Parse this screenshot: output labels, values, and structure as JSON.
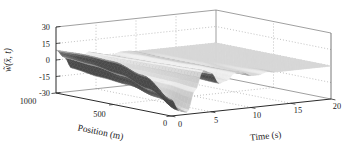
{
  "chart_data": {
    "type": "surface",
    "title": "",
    "time_axis": {
      "label": "Time (s)",
      "range": [
        0,
        20
      ],
      "ticks": [
        0,
        5,
        10,
        15,
        20
      ]
    },
    "position_axis": {
      "label": "Position (m)",
      "range": [
        0,
        1000
      ],
      "ticks": [
        0,
        500,
        1000
      ]
    },
    "z_axis": {
      "label": "w̃(x̄, t)",
      "range": [
        -30,
        30
      ],
      "ticks": [
        -30,
        -15,
        0,
        15,
        30
      ]
    },
    "surface": {
      "positions": [
        0,
        250,
        500,
        750,
        1000
      ],
      "times": [
        0,
        1,
        2,
        3,
        4,
        5,
        6,
        7,
        8,
        9,
        10,
        11,
        12,
        13,
        14,
        15,
        16,
        17,
        18,
        19,
        20
      ],
      "z_values": [
        [
          -15,
          -26,
          -28,
          -9,
          8,
          5,
          -5,
          -3,
          3,
          2,
          -1,
          -1,
          1,
          0,
          0,
          0,
          0,
          0,
          0,
          0,
          0
        ],
        [
          2,
          -12,
          -20,
          -7,
          7,
          4,
          -4,
          -2,
          3,
          1,
          -1,
          -1,
          0,
          0,
          0,
          0,
          0,
          0,
          0,
          0,
          0
        ],
        [
          9,
          -4,
          -14,
          -6,
          6,
          3,
          -4,
          -2,
          2,
          1,
          -1,
          0,
          0,
          0,
          0,
          0,
          0,
          0,
          0,
          0,
          0
        ],
        [
          10,
          0,
          -12,
          -5,
          5,
          3,
          -3,
          -1,
          2,
          1,
          -1,
          0,
          0,
          0,
          0,
          0,
          0,
          0,
          0,
          0,
          0
        ],
        [
          9,
          2,
          -9,
          -3,
          4,
          2,
          -2,
          -1,
          1,
          1,
          0,
          0,
          0,
          0,
          0,
          0,
          0,
          0,
          0,
          0,
          0
        ]
      ]
    },
    "style": {
      "grid": "dotted",
      "legend": "none",
      "background": "#ffffff",
      "colormap": "gray",
      "surface_light": "#f0f0f0",
      "surface_flat": "#d7d7d7",
      "surface_dark": "#6e6e6e",
      "axis_color": "#2b2b2b",
      "box_color": "#777777",
      "grid_color": "#999999",
      "text_color": "#1a1a1a"
    }
  }
}
